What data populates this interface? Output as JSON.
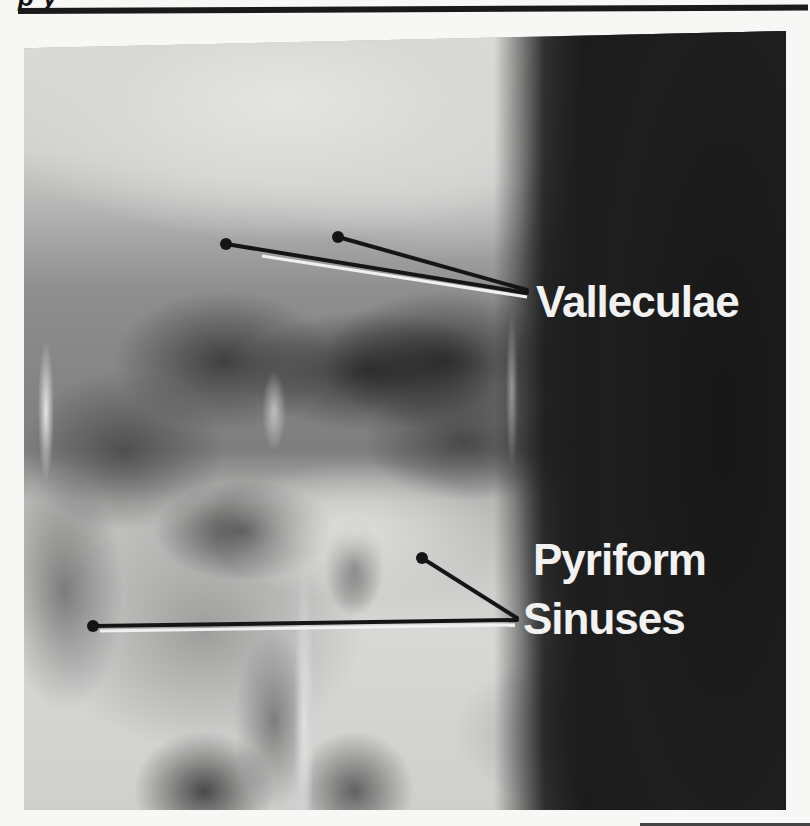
{
  "page": {
    "header_fragment": "p    y",
    "colors": {
      "background": "#f7f7f5",
      "rule": "#1a1a1a",
      "label_text": "#f2f2f2",
      "leader_line": "#151515",
      "leader_highlight": "#f0f0f0"
    }
  },
  "figure": {
    "type": "radiograph",
    "labels": [
      {
        "id": "valleculae",
        "text": "Valleculae",
        "pointers": [
          [
            226,
            244
          ],
          [
            338,
            237
          ]
        ],
        "anchor": [
          527,
          291
        ]
      },
      {
        "id": "pyriform-sinuses",
        "text_line1": "Pyriform",
        "text_line2": "Sinuses",
        "pointers": [
          [
            93,
            626
          ],
          [
            422,
            558
          ]
        ],
        "anchor": [
          515,
          620
        ]
      }
    ]
  }
}
